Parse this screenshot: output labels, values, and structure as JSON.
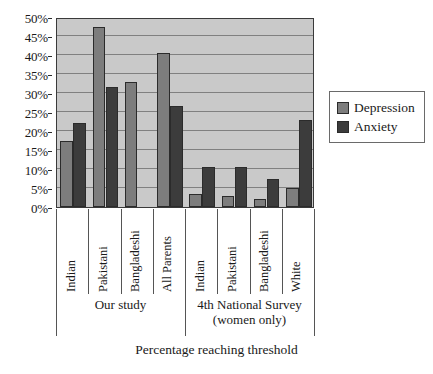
{
  "chart_data": {
    "type": "bar",
    "title": "",
    "xlabel": "Percentage reaching threshold",
    "ylabel": "",
    "ylim": [
      0,
      50
    ],
    "ytick_labels": [
      "0%",
      "5%",
      "10%",
      "15%",
      "20%",
      "25%",
      "30%",
      "35%",
      "40%",
      "45%",
      "50%"
    ],
    "ytick_values": [
      0,
      5,
      10,
      15,
      20,
      25,
      30,
      35,
      40,
      45,
      50
    ],
    "grid": true,
    "legend_position": "right",
    "categories": [
      "Indian",
      "Pakistani",
      "Bangladeshi",
      "All Parents",
      "Indian",
      "Pakistani",
      "Bangladeshi",
      "White"
    ],
    "series": [
      {
        "name": "Depression",
        "color": "#7d7d7d",
        "values": [
          17.5,
          47.5,
          33.0,
          40.5,
          3.5,
          3.0,
          2.0,
          5.0
        ]
      },
      {
        "name": "Anxiety",
        "color": "#3c3c3c",
        "values": [
          22.0,
          31.5,
          null,
          26.5,
          10.5,
          10.5,
          7.5,
          23.0
        ]
      }
    ],
    "groups": [
      {
        "label": "Our study",
        "span": 4
      },
      {
        "label": "4th National Survey\n(women only)",
        "span": 4
      }
    ]
  },
  "legend": {
    "items": [
      {
        "label": "Depression",
        "swatch": "depression-swatch"
      },
      {
        "label": "Anxiety",
        "swatch": "anxiety-swatch"
      }
    ]
  },
  "caption": "Percentage reaching threshold"
}
